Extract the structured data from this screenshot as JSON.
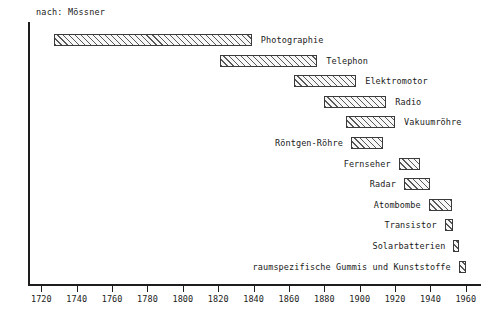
{
  "source_note": "nach: Mössner",
  "axis": {
    "x_ticks": [
      "1720",
      "1740",
      "1760",
      "1780",
      "1800",
      "1820",
      "1840",
      "1860",
      "1880",
      "1900",
      "1920",
      "1940",
      "1960"
    ],
    "x_min": 1713,
    "x_max": 1968
  },
  "chart_data": {
    "type": "bar",
    "orientation": "horizontal",
    "title": "",
    "subtitle": "nach: Mössner",
    "xlabel": "",
    "ylabel": "",
    "xlim": [
      1713,
      1968
    ],
    "grid": false,
    "legend": false,
    "note": "Gantt-style horizontal span bars: time from invention to widespread application",
    "categories": [
      "Photographie",
      "Telephon",
      "Elektromotor",
      "Radio",
      "Vakuumröhre",
      "Röntgen-Röhre",
      "Fernseher",
      "Radar",
      "Atombombe",
      "Transistor",
      "Solarbatterien",
      "raumspezifische Gummis und Kunststoffe"
    ],
    "bars": [
      {
        "label": "Photographie",
        "start": 1727,
        "end": 1839,
        "label_side": "right"
      },
      {
        "label": "Telephon",
        "start": 1821,
        "end": 1876,
        "label_side": "right"
      },
      {
        "label": "Elektromotor",
        "start": 1863,
        "end": 1898,
        "label_side": "right"
      },
      {
        "label": "Radio",
        "start": 1880,
        "end": 1915,
        "label_side": "right"
      },
      {
        "label": "Vakuumröhre",
        "start": 1892,
        "end": 1920,
        "label_side": "right"
      },
      {
        "label": "Röntgen-Röhre",
        "start": 1895,
        "end": 1913,
        "label_side": "left"
      },
      {
        "label": "Fernseher",
        "start": 1922,
        "end": 1934,
        "label_side": "left"
      },
      {
        "label": "Radar",
        "start": 1925,
        "end": 1940,
        "label_side": "left"
      },
      {
        "label": "Atombombe",
        "start": 1939,
        "end": 1952,
        "label_side": "left"
      },
      {
        "label": "Transistor",
        "start": 1948,
        "end": 1953,
        "label_side": "left"
      },
      {
        "label": "Solarbatterien",
        "start": 1953,
        "end": 1955,
        "label_side": "left"
      },
      {
        "label": "raumspezifische Gummis und Kunststoffe",
        "start": 1956,
        "end": 1960,
        "label_side": "left"
      }
    ],
    "values": [
      112,
      55,
      35,
      35,
      28,
      18,
      12,
      15,
      13,
      5,
      2,
      4
    ]
  },
  "colors": {
    "axis": "#1d1d1d",
    "bar_border": "#3a3a3a",
    "bar_fill": "#f7f7f7",
    "hatch": "#3c3c3c",
    "text": "#1a1a1a",
    "background": "#ffffff"
  }
}
